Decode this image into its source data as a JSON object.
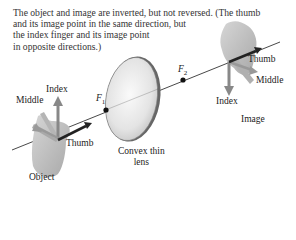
{
  "caption": {
    "lines": [
      "The object and image are inverted, but not reversed. (The thumb",
      "and its image point in the same direction, but",
      "the index finger and its image point",
      "in opposite directions.)"
    ]
  },
  "object_hand": {
    "labels": {
      "index": "Index",
      "middle": "Middle",
      "thumb": "Thumb"
    },
    "caption": "Object"
  },
  "image_hand": {
    "labels": {
      "index": "Index",
      "middle": "Middle",
      "thumb": "Thumb"
    },
    "caption": "Image"
  },
  "lens": {
    "label_line1": "Convex thin",
    "label_line2": "lens"
  },
  "focal_points": {
    "f1": {
      "symbol": "F",
      "subscript": "1"
    },
    "f2": {
      "symbol": "F",
      "subscript": "2"
    }
  },
  "colors": {
    "axis": "#333333",
    "hand": "#bdbdbd",
    "arrow_index": "#8a8a8a",
    "arrow_middle": "#9a9a9a",
    "arrow_thumb": "#222222",
    "lens_fill": "#e8e8e8",
    "lens_edge": "#555555"
  }
}
